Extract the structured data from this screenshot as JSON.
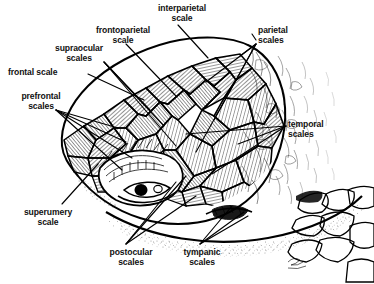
{
  "figure": {
    "medium": "black-and-white line illustration",
    "background_color": "#ffffff",
    "ink_color": "#000000",
    "artist_signature": "signature-mark"
  },
  "labels": [
    {
      "id": "interparietal",
      "line1": "interparietal",
      "line2": "scale",
      "x": 146,
      "y": 4,
      "align": "center",
      "width": 72
    },
    {
      "id": "parietal",
      "line1": "parietal",
      "line2": "scales",
      "x": 258,
      "y": 26,
      "align": "left",
      "width": 60
    },
    {
      "id": "frontoparietal",
      "line1": "frontoparietal",
      "line2": "scale",
      "x": 84,
      "y": 26,
      "align": "center",
      "width": 78
    },
    {
      "id": "supraocular",
      "line1": "supraocular",
      "line2": "scales",
      "x": 44,
      "y": 44,
      "align": "center",
      "width": 70
    },
    {
      "id": "frontal",
      "line1": "frontal scale",
      "line2": "",
      "x": 8,
      "y": 68,
      "align": "left",
      "width": 80
    },
    {
      "id": "prefrontal",
      "line1": "prefrontal",
      "line2": "scales",
      "x": 10,
      "y": 92,
      "align": "center",
      "width": 62
    },
    {
      "id": "temporal",
      "line1": "temporal",
      "line2": "scales",
      "x": 288,
      "y": 120,
      "align": "left",
      "width": 60
    },
    {
      "id": "superumery",
      "line1": "superumery",
      "line2": "scale",
      "x": 12,
      "y": 208,
      "align": "center",
      "width": 72
    },
    {
      "id": "postocular",
      "line1": "postocular",
      "line2": "scales",
      "x": 98,
      "y": 248,
      "align": "center",
      "width": 66
    },
    {
      "id": "tympanic",
      "line1": "tympanic",
      "line2": "scales",
      "x": 172,
      "y": 248,
      "align": "center",
      "width": 60
    }
  ],
  "anatomy_parts": [
    "interparietal scale",
    "parietal scales",
    "frontoparietal scale",
    "supraocular scales",
    "frontal scale",
    "prefrontal scales",
    "temporal scales",
    "superumery scale",
    "postocular scales",
    "tympanic scales",
    "eye",
    "tympanum",
    "neck",
    "throat"
  ]
}
